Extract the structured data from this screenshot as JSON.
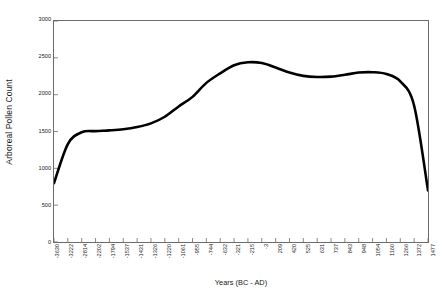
{
  "chart_data": {
    "type": "line",
    "title": "",
    "xlabel": "Years (BC - AD)",
    "ylabel": "Arboreal Pollen Count",
    "ylim": [
      0,
      3000
    ],
    "ytick_labels": [
      "3000",
      "2500",
      "2000",
      "1500",
      "1000",
      "500",
      "0"
    ],
    "ytick_values": [
      3000,
      2500,
      2000,
      1500,
      1000,
      500,
      0
    ],
    "grid": false,
    "legend": null,
    "line_color": "#000000",
    "line_width": 2.6,
    "categories": [
      "-3630",
      "-3222",
      "-2814",
      "-2202",
      "-1794",
      "-1537",
      "-1431",
      "-1326",
      "-1220",
      "-1061",
      "-955",
      "-744",
      "-632",
      "-321",
      "-215",
      "-3",
      "209",
      "420",
      "525",
      "631",
      "737",
      "843",
      "948",
      "1054",
      "1160",
      "1266",
      "1372",
      "1477"
    ],
    "values": [
      800,
      1330,
      1490,
      1505,
      1515,
      1530,
      1560,
      1610,
      1700,
      1840,
      1970,
      2160,
      2290,
      2400,
      2440,
      2430,
      2370,
      2300,
      2255,
      2240,
      2245,
      2270,
      2300,
      2305,
      2280,
      2180,
      1850,
      700
    ],
    "series": [
      {
        "name": "Arboreal Pollen Count",
        "values": [
          800,
          1330,
          1490,
          1505,
          1515,
          1530,
          1560,
          1610,
          1700,
          1840,
          1970,
          2160,
          2290,
          2400,
          2440,
          2430,
          2370,
          2300,
          2255,
          2240,
          2245,
          2270,
          2300,
          2305,
          2280,
          2180,
          1850,
          700
        ]
      }
    ]
  },
  "axes": {
    "y_title": "Arboreal Pollen Count",
    "x_title": "Years (BC - AD)"
  }
}
